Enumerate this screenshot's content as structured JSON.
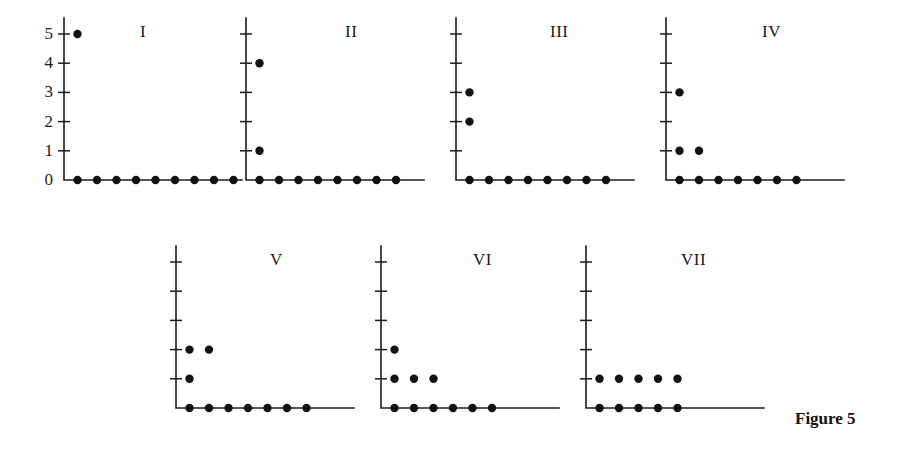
{
  "figure": {
    "caption": "Figure 5",
    "caption_x": 795,
    "caption_y": 409
  },
  "axes": {
    "y_tick_labels": [
      "0",
      "1",
      "2",
      "3",
      "4",
      "5"
    ],
    "y_ticks": [
      0,
      1,
      2,
      3,
      4,
      5
    ],
    "y_min": 0,
    "y_max": 5
  },
  "chart_data": {
    "type": "scatter",
    "title": "Figure 5",
    "xlabel": "",
    "ylabel": "",
    "ylim": [
      0,
      5
    ],
    "grid": false,
    "legend": "none",
    "note": "Seven Young-diagram / partition style dot plots labelled with Roman numerals. Each panel shares the same integer y axis 0..5 (tick labels shown only on panel I). Points sit at integer lattice positions.",
    "panels": [
      {
        "label": "I",
        "row": 0,
        "col": 0,
        "points": [
          {
            "x": 1,
            "y": 5
          },
          {
            "x": 1,
            "y": 0
          },
          {
            "x": 2,
            "y": 0
          },
          {
            "x": 3,
            "y": 0
          },
          {
            "x": 4,
            "y": 0
          },
          {
            "x": 5,
            "y": 0
          },
          {
            "x": 6,
            "y": 0
          },
          {
            "x": 7,
            "y": 0
          },
          {
            "x": 8,
            "y": 0
          },
          {
            "x": 9,
            "y": 0
          }
        ],
        "row_counts": [
          9,
          0,
          0,
          0,
          0,
          1
        ],
        "total_points": 10
      },
      {
        "label": "II",
        "row": 0,
        "col": 1,
        "points": [
          {
            "x": 1,
            "y": 4
          },
          {
            "x": 1,
            "y": 1
          },
          {
            "x": 1,
            "y": 0
          },
          {
            "x": 2,
            "y": 0
          },
          {
            "x": 3,
            "y": 0
          },
          {
            "x": 4,
            "y": 0
          },
          {
            "x": 5,
            "y": 0
          },
          {
            "x": 6,
            "y": 0
          },
          {
            "x": 7,
            "y": 0
          },
          {
            "x": 8,
            "y": 0
          }
        ],
        "row_counts": [
          8,
          1,
          0,
          0,
          1,
          0
        ],
        "total_points": 10
      },
      {
        "label": "III",
        "row": 0,
        "col": 2,
        "points": [
          {
            "x": 1,
            "y": 3
          },
          {
            "x": 1,
            "y": 2
          },
          {
            "x": 1,
            "y": 0
          },
          {
            "x": 2,
            "y": 0
          },
          {
            "x": 3,
            "y": 0
          },
          {
            "x": 4,
            "y": 0
          },
          {
            "x": 5,
            "y": 0
          },
          {
            "x": 6,
            "y": 0
          },
          {
            "x": 7,
            "y": 0
          },
          {
            "x": 8,
            "y": 0
          }
        ],
        "row_counts": [
          8,
          0,
          1,
          1,
          0,
          0
        ],
        "total_points": 10
      },
      {
        "label": "IV",
        "row": 0,
        "col": 3,
        "points": [
          {
            "x": 1,
            "y": 3
          },
          {
            "x": 1,
            "y": 1
          },
          {
            "x": 2,
            "y": 1
          },
          {
            "x": 1,
            "y": 0
          },
          {
            "x": 2,
            "y": 0
          },
          {
            "x": 3,
            "y": 0
          },
          {
            "x": 4,
            "y": 0
          },
          {
            "x": 5,
            "y": 0
          },
          {
            "x": 6,
            "y": 0
          },
          {
            "x": 7,
            "y": 0
          }
        ],
        "row_counts": [
          7,
          2,
          0,
          1,
          0,
          0
        ],
        "total_points": 10
      },
      {
        "label": "V",
        "row": 1,
        "col": 1,
        "points": [
          {
            "x": 1,
            "y": 2
          },
          {
            "x": 2,
            "y": 2
          },
          {
            "x": 1,
            "y": 1
          },
          {
            "x": 1,
            "y": 0
          },
          {
            "x": 2,
            "y": 0
          },
          {
            "x": 3,
            "y": 0
          },
          {
            "x": 4,
            "y": 0
          },
          {
            "x": 5,
            "y": 0
          },
          {
            "x": 6,
            "y": 0
          },
          {
            "x": 7,
            "y": 0
          }
        ],
        "row_counts": [
          7,
          1,
          2,
          0,
          0,
          0
        ],
        "total_points": 10
      },
      {
        "label": "VI",
        "row": 1,
        "col": 2,
        "points": [
          {
            "x": 1,
            "y": 2
          },
          {
            "x": 1,
            "y": 1
          },
          {
            "x": 2,
            "y": 1
          },
          {
            "x": 3,
            "y": 1
          },
          {
            "x": 1,
            "y": 0
          },
          {
            "x": 2,
            "y": 0
          },
          {
            "x": 3,
            "y": 0
          },
          {
            "x": 4,
            "y": 0
          },
          {
            "x": 5,
            "y": 0
          },
          {
            "x": 6,
            "y": 0
          }
        ],
        "row_counts": [
          6,
          3,
          1,
          0,
          0,
          0
        ],
        "total_points": 10
      },
      {
        "label": "VII",
        "row": 1,
        "col": 3,
        "points": [
          {
            "x": 1,
            "y": 1
          },
          {
            "x": 2,
            "y": 1
          },
          {
            "x": 3,
            "y": 1
          },
          {
            "x": 4,
            "y": 1
          },
          {
            "x": 5,
            "y": 1
          },
          {
            "x": 1,
            "y": 0
          },
          {
            "x": 2,
            "y": 0
          },
          {
            "x": 3,
            "y": 0
          },
          {
            "x": 4,
            "y": 0
          },
          {
            "x": 5,
            "y": 0
          }
        ],
        "row_counts": [
          5,
          5,
          0,
          0,
          0,
          0
        ],
        "total_points": 10
      }
    ]
  },
  "layout": {
    "panel_width": 205,
    "panel_height": 200,
    "origin_x": 28,
    "origin_y": 170,
    "x_step": 19.5,
    "y_step": 29.2,
    "dot_radius": 4.2,
    "axis_x_length": 178,
    "axis_top_overshoot": 16,
    "tick_half": 6,
    "columns_x": [
      28,
      238,
      448,
      658
    ],
    "rows_y": [
      10,
      238
    ],
    "bottom_row_columns_x": [
      168,
      373,
      578
    ],
    "title_offsets": [
      {
        "label": "I",
        "x": 140,
        "y": 22
      },
      {
        "label": "II",
        "x": 345,
        "y": 22
      },
      {
        "label": "III",
        "x": 550,
        "y": 22
      },
      {
        "label": "IV",
        "x": 762,
        "y": 22
      },
      {
        "label": "V",
        "x": 270,
        "y": 250
      },
      {
        "label": "VI",
        "x": 473,
        "y": 250
      },
      {
        "label": "VII",
        "x": 681,
        "y": 250
      }
    ]
  }
}
